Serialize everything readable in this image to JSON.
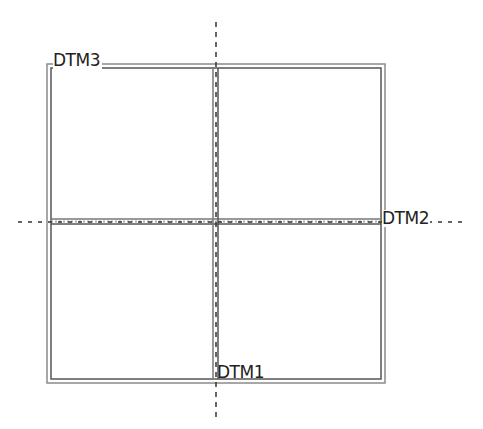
{
  "diagram": {
    "labels": {
      "dtm1": "DTM1",
      "dtm2": "DTM2",
      "dtm3": "DTM3"
    },
    "colors": {
      "line": "#555555",
      "line_light": "#9a9a9a",
      "dash": "#444444",
      "text": "#222222",
      "background": "#ffffff"
    }
  }
}
